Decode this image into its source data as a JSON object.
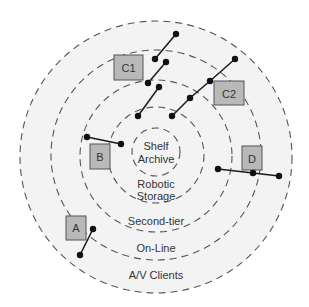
{
  "diagram": {
    "type": "concentric-storage-hierarchy",
    "center": [
      156,
      157
    ],
    "colors": {
      "background_disc": "#f3f3f3",
      "ring_stroke": "#555555",
      "box_fill": "#b9b9b9",
      "line": "#1a1a1a",
      "text": "#333333"
    },
    "rings": [
      {
        "id": "av-clients",
        "r": 136,
        "cy": 157
      },
      {
        "id": "on-line",
        "r": 105,
        "cy": 155
      },
      {
        "id": "second-tier",
        "r": 76,
        "cy": 156
      },
      {
        "id": "robotic-storage",
        "r": 48,
        "cy": 155
      },
      {
        "id": "shelf-archive",
        "r": 24,
        "cy": 152
      }
    ],
    "labels": {
      "shelf": "Shelf",
      "archive": "Archive",
      "robotic": "Robotic",
      "storage": "Storage",
      "second_tier": "Second-tier",
      "on_line": "On-Line",
      "av_clients": "A/V Clients"
    },
    "boxes": {
      "c1": {
        "label": "C1",
        "x": 114,
        "y": 55,
        "w": 29,
        "h": 25
      },
      "c2": {
        "label": "C2",
        "x": 214,
        "y": 81,
        "w": 30,
        "h": 24
      },
      "b": {
        "label": "B",
        "x": 90,
        "y": 144,
        "w": 20,
        "h": 25
      },
      "d": {
        "label": "D",
        "x": 242,
        "y": 146,
        "w": 20,
        "h": 24
      },
      "a": {
        "label": "A",
        "x": 66,
        "y": 216,
        "w": 20,
        "h": 24
      }
    },
    "connectors": [
      {
        "group": "C1",
        "points": [
          [
            155,
            59
          ],
          [
            176,
            34
          ]
        ]
      },
      {
        "group": "C1",
        "points": [
          [
            148,
            83
          ],
          [
            166,
            62
          ]
        ]
      },
      {
        "group": "C1",
        "points": [
          [
            138,
            116
          ],
          [
            159,
            87
          ]
        ]
      },
      {
        "group": "C2",
        "points": [
          [
            172,
            116
          ],
          [
            190,
            98
          ],
          [
            210,
            81
          ],
          [
            235,
            59
          ]
        ]
      },
      {
        "group": "B",
        "points": [
          [
            87,
            137
          ],
          [
            121,
            144
          ]
        ]
      },
      {
        "group": "D",
        "points": [
          [
            218,
            169
          ],
          [
            253,
            173
          ],
          [
            279,
            176
          ]
        ]
      },
      {
        "group": "A",
        "points": [
          [
            80,
            255
          ],
          [
            93,
            229
          ]
        ]
      }
    ]
  }
}
